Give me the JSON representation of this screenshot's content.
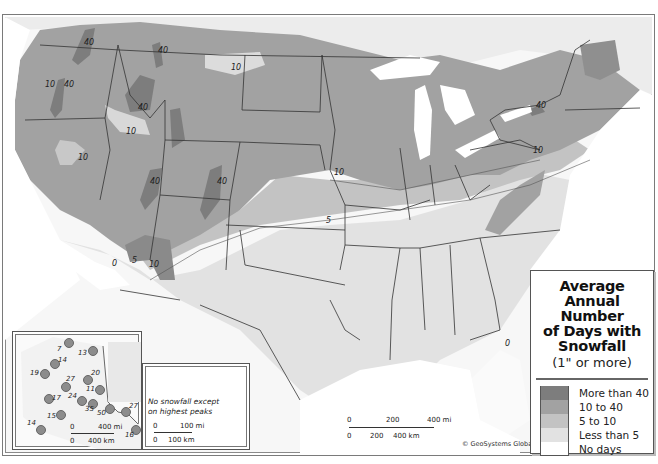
{
  "legend": {
    "title_lines": [
      "Average Annual",
      "Number",
      "of Days with",
      "Snowfall"
    ],
    "subtitle": "(1\" or more)",
    "items": [
      {
        "label": "More than 40",
        "color": "#7d7d7d"
      },
      {
        "label": "10 to 40",
        "color": "#a2a2a2"
      },
      {
        "label": "5 to 10",
        "color": "#c3c3c3"
      },
      {
        "label": "Less than 5",
        "color": "#e2e2e2"
      },
      {
        "label": "No days",
        "color": "#ffffff"
      }
    ]
  },
  "contour_labels": [
    {
      "text": "40",
      "x": 84,
      "y": 44
    },
    {
      "text": "40",
      "x": 158,
      "y": 52
    },
    {
      "text": "10",
      "x": 47,
      "y": 85
    },
    {
      "text": "40",
      "x": 66,
      "y": 85
    },
    {
      "text": "40",
      "x": 140,
      "y": 108
    },
    {
      "text": "10",
      "x": 128,
      "y": 132
    },
    {
      "text": "10",
      "x": 233,
      "y": 68
    },
    {
      "text": "10",
      "x": 80,
      "y": 158
    },
    {
      "text": "40",
      "x": 151,
      "y": 178
    },
    {
      "text": "40",
      "x": 218,
      "y": 178
    },
    {
      "text": "0",
      "x": 113,
      "y": 264
    },
    {
      "text": "5",
      "x": 133,
      "y": 261
    },
    {
      "text": "10",
      "x": 150,
      "y": 264
    },
    {
      "text": "10",
      "x": 335,
      "y": 170
    },
    {
      "text": "5",
      "x": 327,
      "y": 221
    },
    {
      "text": "10",
      "x": 534,
      "y": 151
    },
    {
      "text": "40",
      "x": 537,
      "y": 106
    },
    {
      "text": "0",
      "x": 505,
      "y": 342
    }
  ],
  "alaska_inset": {
    "stations": [
      {
        "value": "7",
        "x": 66,
        "y": 340
      },
      {
        "value": "13",
        "x": 90,
        "y": 348
      },
      {
        "value": "14",
        "x": 51,
        "y": 361
      },
      {
        "value": "19",
        "x": 41,
        "y": 371
      },
      {
        "value": "20",
        "x": 84,
        "y": 376
      },
      {
        "value": "27",
        "x": 62,
        "y": 383
      },
      {
        "value": "11",
        "x": 96,
        "y": 386
      },
      {
        "value": "17",
        "x": 45,
        "y": 395
      },
      {
        "value": "24",
        "x": 78,
        "y": 397
      },
      {
        "value": "35",
        "x": 89,
        "y": 400
      },
      {
        "value": "50",
        "x": 106,
        "y": 405
      },
      {
        "value": "27",
        "x": 122,
        "y": 408
      },
      {
        "value": "15",
        "x": 57,
        "y": 411
      },
      {
        "value": "14",
        "x": 37,
        "y": 426
      },
      {
        "value": "16",
        "x": 132,
        "y": 426
      }
    ],
    "scale_mi": {
      "start": "0",
      "end": "400 mi"
    },
    "scale_km": {
      "start": "0",
      "end": "400 km"
    }
  },
  "hawaii_inset": {
    "note_lines": [
      "No snowfall except",
      "on highest peaks"
    ],
    "scale_mi": {
      "start": "0",
      "end": "100 mi"
    },
    "scale_km": {
      "start": "0",
      "end": "100 km"
    }
  },
  "main_scale": {
    "mi": [
      "0",
      "200",
      "400 mi"
    ],
    "km": [
      "0",
      "200",
      "400 km"
    ]
  },
  "credit": "© GeoSystems Global Corp."
}
